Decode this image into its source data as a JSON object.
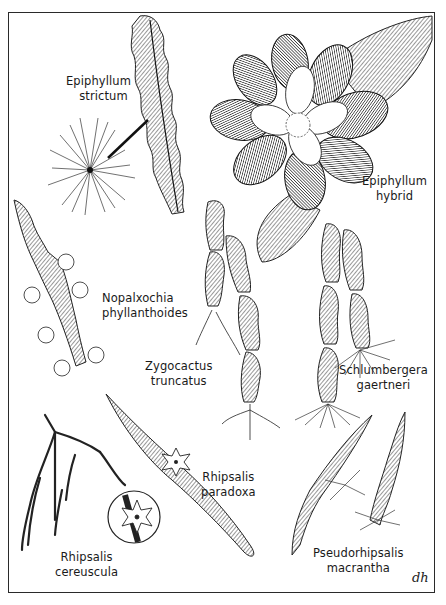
{
  "plate": {
    "subject": "Epiphytic cacti botanical illustration",
    "border_color": "#2a2a2a",
    "ink_color": "#1a1a1a",
    "background": "#ffffff"
  },
  "labels": [
    {
      "id": "epiphyllum-strictum",
      "line1": "Epiphyllum",
      "line2": "strictum"
    },
    {
      "id": "epiphyllum-hybrid",
      "line1": "Epiphyllum",
      "line2": "hybrid"
    },
    {
      "id": "nopalxochia-phyllanthoides",
      "line1": "Nopalxochia",
      "line2": "phyllanthoides"
    },
    {
      "id": "zygocactus-truncatus",
      "line1": "Zygocactus",
      "line2": "truncatus"
    },
    {
      "id": "schlumbergera-gaertneri",
      "line1": "Schlumbergera",
      "line2": "gaertneri"
    },
    {
      "id": "rhipsalis-paradoxa",
      "line1": "Rhipsalis",
      "line2": "paradoxa"
    },
    {
      "id": "rhipsalis-cereuscula",
      "line1": "Rhipsalis",
      "line2": "cereuscula"
    },
    {
      "id": "pseudorhipsalis-macrantha",
      "line1": "Pseudorhipsalis",
      "line2": "macrantha"
    }
  ],
  "signature": "dh"
}
